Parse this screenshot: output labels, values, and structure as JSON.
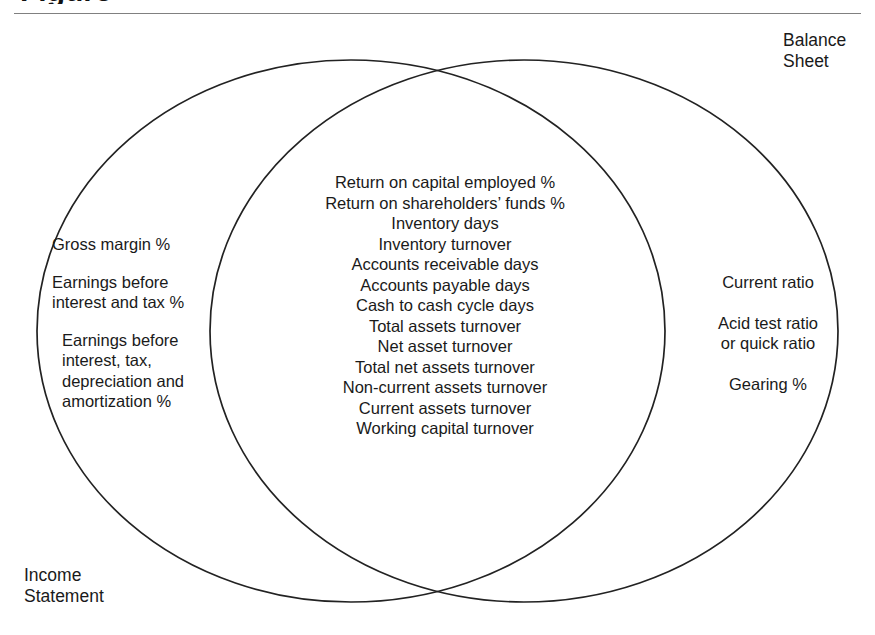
{
  "page": {
    "title_fragment": "Figure",
    "background_color": "#ffffff",
    "rule_color": "#808080",
    "stroke_color": "#222222"
  },
  "diagram": {
    "type": "venn",
    "sets": [
      {
        "id": "income-statement",
        "label": "Income\nStatement"
      },
      {
        "id": "balance-sheet",
        "label": "Balance\nSheet"
      }
    ],
    "left_only": [
      "Gross margin %",
      "Earnings before\ninterest and tax %",
      "Earnings before\ninterest, tax,\ndepreciation and\namortization %"
    ],
    "intersection": [
      "Return on capital employed %",
      "Return on shareholders’ funds %",
      "Inventory days",
      "Inventory turnover",
      "Accounts receivable days",
      "Accounts payable days",
      "Cash to cash cycle days",
      "Total assets turnover",
      "Net asset turnover",
      "Total net assets turnover",
      "Non-current assets turnover",
      "Current assets turnover",
      "Working capital turnover"
    ],
    "right_only": [
      "Current ratio",
      "Acid test ratio\nor quick ratio",
      "Gearing %"
    ]
  }
}
